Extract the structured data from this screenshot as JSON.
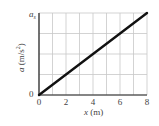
{
  "chart_data": {
    "type": "line",
    "title": "",
    "xlabel": "x (m)",
    "ylabel": "a (m/s²)",
    "x": [
      0,
      8
    ],
    "series": [
      {
        "name": "a vs x",
        "values": [
          0,
          1
        ],
        "description": "straight line from origin to (8, a_s)"
      }
    ],
    "xlim": [
      0,
      8
    ],
    "ylim": [
      0,
      1
    ],
    "x_ticks": [
      "0",
      "2",
      "4",
      "6",
      "8"
    ],
    "y_ticks": [
      "0",
      "a_s"
    ],
    "y_tick_labels_display": {
      "bottom": "0",
      "top": "a",
      "top_subscript": "s"
    },
    "grid": {
      "on": true,
      "x_step": 1,
      "y_divisions": 4,
      "color": "#c8c8c8"
    },
    "legend": null,
    "line_color": "#111111"
  },
  "axes": {
    "x_label_var": "x",
    "x_label_unit": " (m)",
    "y_label_var": "a",
    "y_label_unit_open": " (m/s",
    "y_label_unit_sup": "2",
    "y_label_unit_close": ")"
  }
}
